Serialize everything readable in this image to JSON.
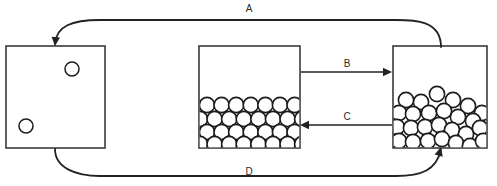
{
  "diagram": {
    "canvas": {
      "width": 497,
      "height": 186,
      "background": "#ffffff"
    },
    "stroke_color": "#222222",
    "box_stroke_color": "#3a3a3a",
    "particle_fill": "#ffffff",
    "particle_stroke": "#1c1c1c",
    "labels": {
      "a": "A",
      "b": "B",
      "c": "C",
      "d": "D"
    },
    "boxes": [
      {
        "name": "gas-container",
        "x": 6,
        "y": 46,
        "width": 99,
        "height": 102,
        "particle_radius": 7,
        "particles": [
          {
            "cx": 72,
            "cy": 69
          },
          {
            "cx": 26,
            "cy": 126
          }
        ]
      },
      {
        "name": "ordered-solid-container",
        "x": 199,
        "y": 46,
        "width": 101,
        "height": 102,
        "particle_radius": 7.6,
        "fill_level_y": 98
      },
      {
        "name": "disordered-liquid-container",
        "x": 393,
        "y": 46,
        "width": 94,
        "height": 102,
        "particle_radius": 7.6
      }
    ],
    "ordered_rows": [
      {
        "y": 105,
        "start_x": 207,
        "count": 7,
        "spacing": 14.6
      },
      {
        "y": 119,
        "start_x": 200,
        "count": 8,
        "spacing": 14.6
      },
      {
        "y": 132,
        "start_x": 207,
        "count": 7,
        "spacing": 14.6
      },
      {
        "y": 144,
        "start_x": 200,
        "count": 8,
        "spacing": 14.6
      }
    ],
    "disordered_particles": [
      {
        "cx": 437,
        "cy": 94
      },
      {
        "cx": 453,
        "cy": 100
      },
      {
        "cx": 421,
        "cy": 102
      },
      {
        "cx": 406,
        "cy": 100
      },
      {
        "cx": 468,
        "cy": 106
      },
      {
        "cx": 482,
        "cy": 113
      },
      {
        "cx": 399,
        "cy": 113
      },
      {
        "cx": 413,
        "cy": 114
      },
      {
        "cx": 429,
        "cy": 113
      },
      {
        "cx": 444,
        "cy": 111
      },
      {
        "cx": 458,
        "cy": 117
      },
      {
        "cx": 473,
        "cy": 121
      },
      {
        "cx": 397,
        "cy": 127
      },
      {
        "cx": 411,
        "cy": 128
      },
      {
        "cx": 425,
        "cy": 127
      },
      {
        "cx": 439,
        "cy": 125
      },
      {
        "cx": 452,
        "cy": 130
      },
      {
        "cx": 466,
        "cy": 134
      },
      {
        "cx": 480,
        "cy": 128
      },
      {
        "cx": 399,
        "cy": 141
      },
      {
        "cx": 413,
        "cy": 142
      },
      {
        "cx": 428,
        "cy": 141
      },
      {
        "cx": 442,
        "cy": 139
      },
      {
        "cx": 456,
        "cy": 143
      },
      {
        "cx": 470,
        "cy": 146
      },
      {
        "cx": 483,
        "cy": 141
      }
    ],
    "connectors": [
      {
        "name": "transition-a",
        "label": "A",
        "label_x": 249,
        "label_y": 9,
        "direction": "right-to-left",
        "path": "M 441 47 C 441 20 414 20 396 20 L 100 20 C 72 20 56 26 55 44"
      },
      {
        "name": "transition-b",
        "label": "B",
        "label_x": 347,
        "label_y": 64,
        "direction": "left-to-right",
        "path": "M 301 72 L 386 72"
      },
      {
        "name": "transition-c",
        "label": "C",
        "label_x": 347,
        "label_y": 117,
        "direction": "right-to-left",
        "path": "M 392 125 L 306 125"
      },
      {
        "name": "transition-d",
        "label": "D",
        "label_x": 249,
        "label_y": 172,
        "direction": "left-to-right",
        "path": "M 55 149 C 55 168 76 176 100 176 L 396 176 C 422 176 436 170 441 150"
      }
    ]
  }
}
